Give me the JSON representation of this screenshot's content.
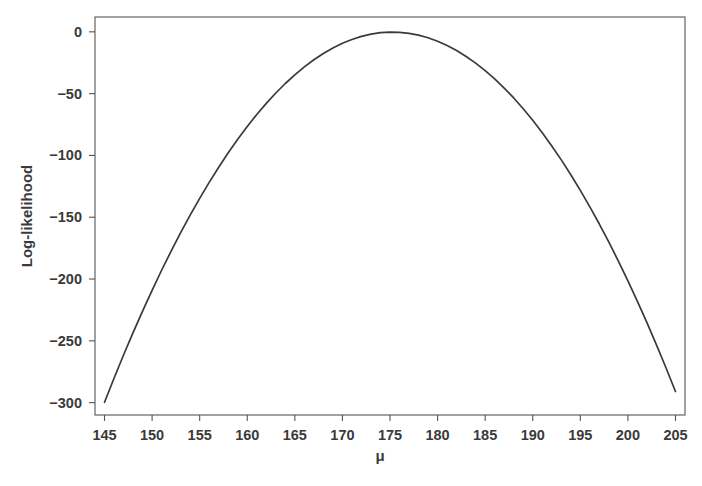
{
  "chart_data": {
    "type": "line",
    "title": "",
    "xlabel": "μ",
    "ylabel": "Log-likelihood",
    "xlim": [
      144,
      206
    ],
    "ylim": [
      -310,
      12
    ],
    "xticks": [
      145,
      150,
      155,
      160,
      165,
      170,
      175,
      180,
      185,
      190,
      195,
      200,
      205
    ],
    "yticks": [
      0,
      -50,
      -100,
      -150,
      -200,
      -250,
      -300
    ],
    "xtick_labels": [
      "145",
      "150",
      "155",
      "160",
      "165",
      "170",
      "175",
      "180",
      "185",
      "190",
      "195",
      "200",
      "205"
    ],
    "ytick_labels": [
      "0",
      "−50",
      "−100",
      "−150",
      "−200",
      "−250",
      "−300"
    ],
    "grid": false,
    "legend": "none",
    "frame": "box",
    "series": [
      {
        "name": "log-likelihood",
        "color": "#3a3a3a",
        "x": [
          145,
          146,
          147,
          148,
          149,
          150,
          151,
          152,
          153,
          154,
          155,
          156,
          157,
          158,
          159,
          160,
          161,
          162,
          163,
          164,
          165,
          166,
          167,
          168,
          169,
          170,
          171,
          172,
          173,
          174,
          175,
          176,
          177,
          178,
          179,
          180,
          181,
          182,
          183,
          184,
          185,
          186,
          187,
          188,
          189,
          190,
          191,
          192,
          193,
          194,
          195,
          196,
          197,
          198,
          199,
          200,
          201,
          202,
          203,
          204,
          205
        ],
        "y": [
          -299.7,
          -280.3,
          -261.5,
          -243.4,
          -225.9,
          -209.1,
          -192.9,
          -177.4,
          -162.5,
          -148.3,
          -134.7,
          -121.8,
          -109.5,
          -97.9,
          -86.9,
          -76.6,
          -66.9,
          -57.9,
          -49.5,
          -41.8,
          -34.8,
          -28.4,
          -22.6,
          -17.5,
          -13.1,
          -9.3,
          -6.2,
          -3.7,
          -1.9,
          -0.7,
          -0.2,
          -0.4,
          -1.2,
          -2.7,
          -4.8,
          -7.6,
          -11.0,
          -15.1,
          -19.9,
          -25.3,
          -31.4,
          -38.1,
          -45.5,
          -53.5,
          -62.2,
          -71.6,
          -81.6,
          -92.3,
          -103.6,
          -115.6,
          -128.3,
          -141.6,
          -155.5,
          -170.2,
          -185.5,
          -201.4,
          -218.0,
          -235.3,
          -253.2,
          -271.8,
          -291.0
        ]
      }
    ],
    "annotations": {
      "peak_mu": 175,
      "peak_value": 0
    }
  },
  "colors": {
    "background": "#ffffff",
    "axis": "#555555",
    "curve": "#3a3a3a",
    "text": "#3a3a3a"
  }
}
